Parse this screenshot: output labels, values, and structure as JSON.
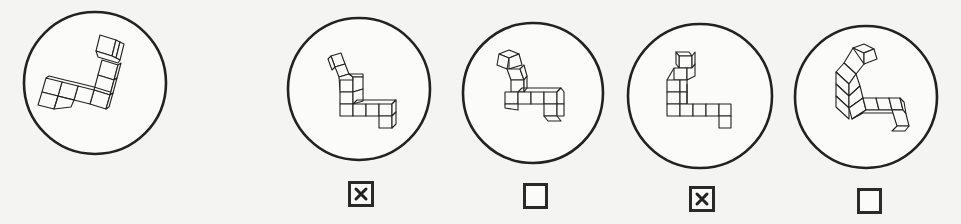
{
  "task": {
    "type": "mental-rotation",
    "reference_figure": {
      "id": "reference",
      "circle": {
        "cx": 95,
        "cy": 83,
        "r": 71
      },
      "rotation_deg": 0
    },
    "options": [
      {
        "id": "option-1",
        "circle": {
          "cx": 359,
          "cy": 89,
          "r": 71
        },
        "checked": true,
        "checkbox": {
          "x": 348,
          "y": 181,
          "w": 26,
          "h": 26
        }
      },
      {
        "id": "option-2",
        "circle": {
          "cx": 533,
          "cy": 93,
          "r": 70
        },
        "checked": false,
        "checkbox": {
          "x": 523,
          "y": 183,
          "w": 25,
          "h": 26
        }
      },
      {
        "id": "option-3",
        "circle": {
          "cx": 700,
          "cy": 96,
          "r": 72
        },
        "checked": true,
        "checkbox": {
          "x": 689,
          "y": 186,
          "w": 26,
          "h": 26
        }
      },
      {
        "id": "option-4",
        "circle": {
          "cx": 866,
          "cy": 97,
          "r": 71
        },
        "checked": false,
        "checkbox": {
          "x": 857,
          "y": 188,
          "w": 25,
          "h": 26
        }
      }
    ]
  },
  "colors": {
    "background": "#f4f4f2",
    "stroke": "#222222",
    "circle_fill": "#fbfbfa",
    "checkbox_border": "#2a2a2a"
  },
  "icons": {
    "checked_mark": "x-mark-icon",
    "unchecked": "empty-box-icon"
  }
}
